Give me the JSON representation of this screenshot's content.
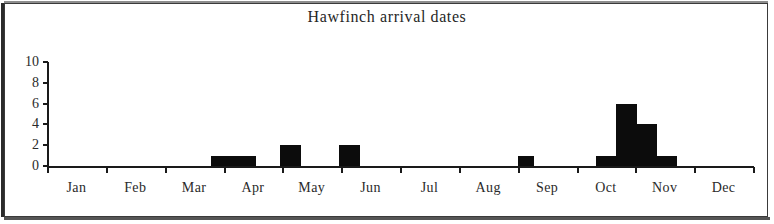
{
  "chart_data": {
    "type": "bar",
    "title": "Hawfinch arrival dates",
    "xlabel": "",
    "ylabel": "",
    "ylim": [
      0,
      10
    ],
    "yticks": [
      0,
      2,
      4,
      6,
      8,
      10
    ],
    "grid": false,
    "legend": null,
    "categories": [
      "Jan",
      "Feb",
      "Mar",
      "Apr",
      "May",
      "Jun",
      "Jul",
      "Aug",
      "Sep",
      "Oct",
      "Nov",
      "Dec"
    ],
    "bin_description": "Counts binned by part-month (approx. weekly/half-month intervals) across the year",
    "bars": [
      {
        "label": "late Mar",
        "month": "Mar",
        "value": 1,
        "x_frac": 0.232,
        "width_frac": 0.064
      },
      {
        "label": "mid Apr",
        "month": "Apr",
        "value": 2,
        "x_frac": 0.33,
        "width_frac": 0.03
      },
      {
        "label": "early May",
        "month": "May",
        "value": 2,
        "x_frac": 0.414,
        "width_frac": 0.03
      },
      {
        "label": "early Sep",
        "month": "Sep",
        "value": 1,
        "x_frac": 0.667,
        "width_frac": 0.023
      },
      {
        "label": "late Sep",
        "month": "Oct",
        "value": 1,
        "x_frac": 0.777,
        "width_frac": 0.029
      },
      {
        "label": "early Oct",
        "month": "Oct",
        "value": 6,
        "x_frac": 0.806,
        "width_frac": 0.029
      },
      {
        "label": "mid Oct",
        "month": "Oct",
        "value": 4,
        "x_frac": 0.835,
        "width_frac": 0.029
      },
      {
        "label": "late Oct",
        "month": "Oct",
        "value": 1,
        "x_frac": 0.864,
        "width_frac": 0.029
      }
    ],
    "values_by_month": {
      "Jan": 0,
      "Feb": 0,
      "Mar": 1,
      "Apr": 2,
      "May": 2,
      "Jun": 0,
      "Jul": 0,
      "Aug": 0,
      "Sep": 1,
      "Oct": 12,
      "Nov": 0,
      "Dec": 0
    },
    "colors": {
      "bar": "#0c0c0c",
      "axis": "#1a1a1a",
      "text": "#2a2a2a",
      "background": "#ffffff",
      "frame": "#3a3a3a"
    }
  }
}
